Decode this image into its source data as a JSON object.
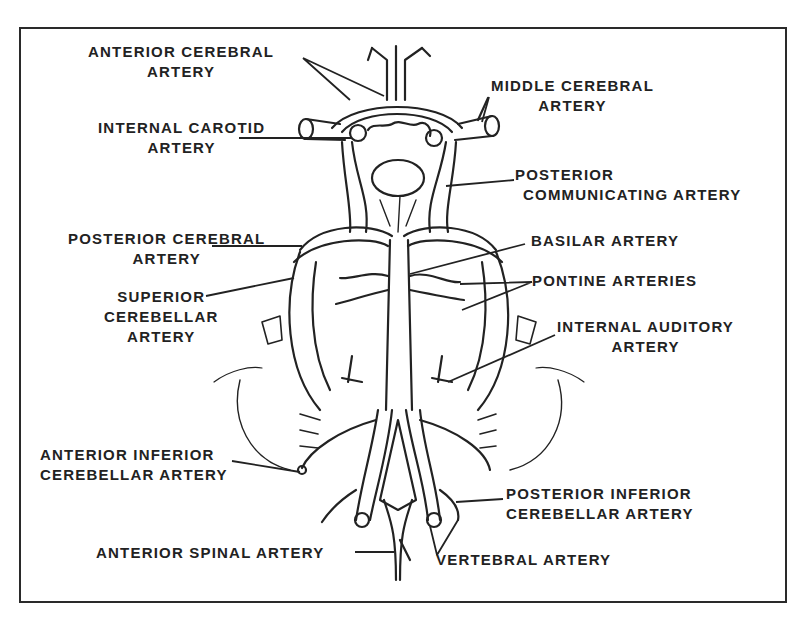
{
  "diagram": {
    "type": "anatomical-line-drawing",
    "colors": {
      "ink": "#222222",
      "background": "#ffffff",
      "frame": "#2a2a2a"
    },
    "labels": {
      "anterior_cerebral": {
        "line1": "ANTERIOR CEREBRAL",
        "line2": "ARTERY"
      },
      "internal_carotid": {
        "line1": "INTERNAL CAROTID",
        "line2": "ARTERY"
      },
      "middle_cerebral": {
        "line1": "MIDDLE CEREBRAL",
        "line2": "ARTERY"
      },
      "posterior_communicating": {
        "line1": "POSTERIOR",
        "line2": "COMMUNICATING ARTERY"
      },
      "posterior_cerebral": {
        "line1": "POSTERIOR CEREBRAL",
        "line2": "ARTERY"
      },
      "basilar": {
        "line1": "BASILAR ARTERY"
      },
      "pontine": {
        "line1": "PONTINE ARTERIES"
      },
      "superior_cerebellar": {
        "line1": "SUPERIOR",
        "line2": "CEREBELLAR",
        "line3": "ARTERY"
      },
      "internal_auditory": {
        "line1": "INTERNAL AUDITORY",
        "line2": "ARTERY"
      },
      "anterior_inferior_cerebellar": {
        "line1": "ANTERIOR INFERIOR",
        "line2": "CEREBELLAR ARTERY"
      },
      "posterior_inferior_cerebellar": {
        "line1": "POSTERIOR INFERIOR",
        "line2": "CEREBELLAR ARTERY"
      },
      "anterior_spinal": {
        "line1": "ANTERIOR SPINAL ARTERY"
      },
      "vertebral": {
        "line1": "VERTEBRAL ARTERY"
      }
    }
  }
}
